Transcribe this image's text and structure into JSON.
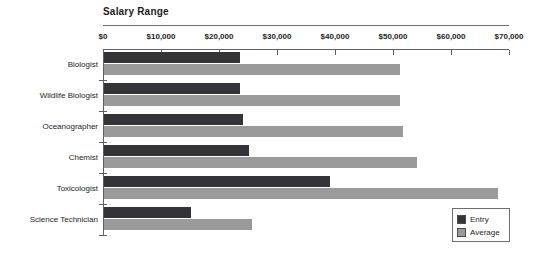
{
  "chart_data": {
    "type": "bar",
    "orientation": "horizontal",
    "title": "Salary Range",
    "xlabel": "",
    "ylabel": "",
    "xlim": [
      0,
      70000
    ],
    "xticks": [
      0,
      10000,
      20000,
      30000,
      40000,
      50000,
      60000,
      70000
    ],
    "xtick_labels": [
      "$0",
      "$10,000",
      "$20,000",
      "$30,000",
      "$40,000",
      "$50,000",
      "$60,000",
      "$70,000"
    ],
    "grid": false,
    "legend_position": "bottom-right",
    "categories": [
      "Biologist",
      "Wildlife Biologist",
      "Oceanographer",
      "Chemist",
      "Toxicologist",
      "Science Technician"
    ],
    "series": [
      {
        "name": "Entry",
        "color": "#333338",
        "values": [
          23500,
          23500,
          24000,
          25000,
          39000,
          15000
        ]
      },
      {
        "name": "Average",
        "color": "#9a9a9a",
        "values": [
          51000,
          51000,
          51500,
          54000,
          68000,
          25500
        ]
      }
    ]
  },
  "legend": {
    "entries": [
      {
        "label": "Entry",
        "color": "#333338"
      },
      {
        "label": "Average",
        "color": "#9a9a9a"
      }
    ]
  }
}
